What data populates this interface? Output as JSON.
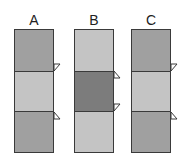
{
  "colors": {
    "medium": "#a0a0a0",
    "light": "#c4c4c4",
    "dark": "#7c7c7c",
    "border": "#3a3a3a"
  },
  "columns": [
    {
      "label": "A",
      "segments": [
        "medium",
        "light",
        "medium"
      ],
      "markers": [
        "lower-left-of-first-boundary",
        "below-second-boundary"
      ]
    },
    {
      "label": "B",
      "segments": [
        "light",
        "dark",
        "light"
      ],
      "markers": [
        "below-first-boundary",
        "above-second-boundary"
      ]
    },
    {
      "label": "C",
      "segments": [
        "medium",
        "light",
        "medium"
      ],
      "markers": [
        "above-first-boundary",
        "below-second-boundary"
      ]
    }
  ]
}
